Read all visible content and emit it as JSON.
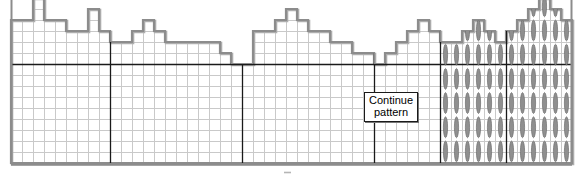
{
  "figure": {
    "type": "grid-step-histogram",
    "width": 583,
    "height": 179,
    "annotation_label_line1": "Continue",
    "annotation_label_line2": "pattern",
    "bottom_tick_mark": "-",
    "colors": {
      "grid_line": "#c9c9c9",
      "grid_line_strong": "#9a9a9a",
      "outline": "#8c8c8c",
      "outline_shadow": "#aeaeae",
      "section_divider": "#1a1a1a",
      "baseline": "#1a1a1a",
      "border": "#8c8c8c",
      "ellipse_fill": "#8f8f8f",
      "ellipse_stroke": "#6e6e6e",
      "note_border": "#1a1a1a",
      "note_background": "#ffffff",
      "note_text": "#000000",
      "page_background": "#ffffff"
    }
  },
  "geometry": {
    "plot_left": 11,
    "plot_right": 572,
    "plot_bottom": 163,
    "cell_width": 11.0,
    "cell_height": 11.0,
    "columns": 51,
    "rows_visible": 15,
    "baseline_row_from_bottom": 9,
    "section_divider_columns": [
      9,
      21,
      33,
      39,
      45
    ],
    "ellipse_start_column": 39
  },
  "chart_data": {
    "type": "bar",
    "title": "",
    "subtitle": "",
    "xlabel": "",
    "ylabel": "",
    "grid": true,
    "legend": "none",
    "ylim": [
      0,
      15
    ],
    "xlim": [
      0,
      51
    ],
    "categories": [
      "1",
      "2",
      "3",
      "4",
      "5",
      "6",
      "7",
      "8",
      "9",
      "10",
      "11",
      "12",
      "13",
      "14",
      "15",
      "16",
      "17",
      "18",
      "19",
      "20",
      "21",
      "22",
      "23",
      "24",
      "25",
      "26",
      "27",
      "28",
      "29",
      "30",
      "31",
      "32",
      "33",
      "34",
      "35",
      "36",
      "37",
      "38",
      "39",
      "40",
      "41",
      "42",
      "43",
      "44",
      "45",
      "46",
      "47",
      "48",
      "49",
      "50",
      "51"
    ],
    "values": [
      13,
      13,
      15,
      13,
      13,
      12,
      12,
      14,
      12,
      11,
      11,
      12,
      13,
      12,
      11,
      11,
      11,
      11,
      11,
      10,
      9,
      9,
      12,
      12,
      13,
      14,
      13,
      12,
      12,
      11,
      11,
      10,
      10,
      9,
      10,
      11,
      12,
      13,
      12,
      11,
      11,
      12,
      13,
      12,
      11,
      12,
      13,
      14,
      15,
      14,
      13
    ],
    "note_annotation": "Continue pattern",
    "note_annotation_column": 32,
    "baseline_value": 9,
    "marked_columns_description": "columns 39 through 51 carry vertical ellipse markers",
    "series": [
      {
        "name": "pattern",
        "values": [
          13,
          13,
          15,
          13,
          13,
          12,
          12,
          14,
          12,
          11,
          11,
          12,
          13,
          12,
          11,
          11,
          11,
          11,
          11,
          10,
          9,
          9,
          12,
          12,
          13,
          14,
          13,
          12,
          12,
          11,
          11,
          10,
          10,
          9,
          10,
          11,
          12,
          13,
          12,
          11,
          11,
          12,
          13,
          12,
          11,
          12,
          13,
          14,
          15,
          14,
          13
        ]
      }
    ]
  }
}
